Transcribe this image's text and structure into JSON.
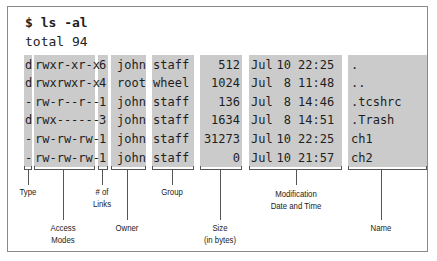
{
  "command": "$ ls -al",
  "total": "total 94",
  "columns": [
    "Type",
    "Access Modes",
    "# of Links",
    "Owner",
    "Group",
    "Size (in bytes)",
    "Modification Date and Time",
    "Name"
  ],
  "rows": [
    {
      "type": "d",
      "mode": "rwxr-xr-x",
      "links": "6",
      "owner": "john",
      "group": "staff",
      "size": "512",
      "month": "Jul",
      "day": "10",
      "time": "22:25",
      "name": "."
    },
    {
      "type": "d",
      "mode": "rwxrwxr-x",
      "links": "4",
      "owner": "root",
      "group": "wheel",
      "size": "1024",
      "month": "Jul",
      "day": "8",
      "time": "11:48",
      "name": ".."
    },
    {
      "type": "-",
      "mode": "rw-r--r--",
      "links": "1",
      "owner": "john",
      "group": "staff",
      "size": "136",
      "month": "Jul",
      "day": "8",
      "time": "14:46",
      "name": ".tcshrc"
    },
    {
      "type": "d",
      "mode": "rwx------",
      "links": "3",
      "owner": "john",
      "group": "staff",
      "size": "1634",
      "month": "Jul",
      "day": "8",
      "time": "14:51",
      "name": ".Trash"
    },
    {
      "type": "-",
      "mode": "rw-rw-rw-",
      "links": "1",
      "owner": "john",
      "group": "staff",
      "size": "31273",
      "month": "Jul",
      "day": "10",
      "time": "22:25",
      "name": "ch1"
    },
    {
      "type": "-",
      "mode": "rw-rw-rw-",
      "links": "1",
      "owner": "john",
      "group": "staff",
      "size": "0",
      "month": "Jul",
      "day": "10",
      "time": "21:57",
      "name": "ch2"
    }
  ],
  "labels": {
    "type": "Type",
    "access_modes": "Access\nModes",
    "links": "# of\nLinks",
    "owner": "Owner",
    "group": "Group",
    "size": "Size\n(in bytes)",
    "modification": "Modification\nDate and Time",
    "name": "Name"
  },
  "colors": {
    "column_fill": "#cbcbcb",
    "frame_border": "#8a8a8a",
    "text": "#1e1e1e"
  }
}
